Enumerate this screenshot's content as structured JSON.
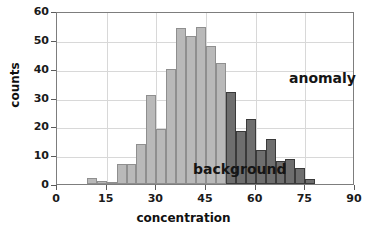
{
  "chart_data": {
    "type": "bar",
    "title": "",
    "subtitle": "",
    "xlabel": "concentration",
    "ylabel": "counts",
    "xlim": [
      0,
      90
    ],
    "ylim": [
      0,
      60
    ],
    "xticks": [
      0,
      15,
      30,
      45,
      60,
      75,
      90
    ],
    "yticks": [
      0,
      10,
      20,
      30,
      40,
      50,
      60
    ],
    "grid": true,
    "legend_position": "in-plot-annotations",
    "bin_width": 3,
    "annotations": [
      {
        "text": "anomaly",
        "x": 63,
        "y": 44
      },
      {
        "text": "background",
        "x": 35,
        "y": 12
      }
    ],
    "series": [
      {
        "name": "background",
        "color": "#b9b9b9",
        "edge_color": "#8f8f8f",
        "bins": [
          {
            "x0": 9,
            "x1": 12,
            "value": 2.0
          },
          {
            "x0": 12,
            "x1": 15,
            "value": 1.0
          },
          {
            "x0": 15,
            "x1": 18,
            "value": 0.3
          },
          {
            "x0": 18,
            "x1": 21,
            "value": 7.0
          },
          {
            "x0": 21,
            "x1": 24,
            "value": 7.0
          },
          {
            "x0": 24,
            "x1": 27,
            "value": 14.0
          },
          {
            "x0": 27,
            "x1": 30,
            "value": 31.0
          },
          {
            "x0": 30,
            "x1": 33,
            "value": 19.0
          },
          {
            "x0": 33,
            "x1": 36,
            "value": 40.0
          },
          {
            "x0": 36,
            "x1": 39,
            "value": 54.0
          },
          {
            "x0": 39,
            "x1": 42,
            "value": 51.5
          },
          {
            "x0": 42,
            "x1": 45,
            "value": 54.5
          },
          {
            "x0": 45,
            "x1": 48,
            "value": 48.0
          },
          {
            "x0": 48,
            "x1": 51,
            "value": 42.0
          },
          {
            "x0": 51,
            "x1": 54,
            "value": 31.0
          },
          {
            "x0": 54,
            "x1": 57,
            "value": 18.5
          },
          {
            "x0": 57,
            "x1": 60,
            "value": 11.5
          },
          {
            "x0": 60,
            "x1": 63,
            "value": 3.5
          },
          {
            "x0": 63,
            "x1": 66,
            "value": 3.5
          },
          {
            "x0": 66,
            "x1": 69,
            "value": 3.0
          },
          {
            "x0": 69,
            "x1": 72,
            "value": 3.0
          },
          {
            "x0": 72,
            "x1": 75,
            "value": 1.0
          }
        ]
      },
      {
        "name": "anomaly",
        "color": "#6e6e6e",
        "edge_color": "#3a3a3a",
        "bins": [
          {
            "x0": 51,
            "x1": 54,
            "value": 31.8
          },
          {
            "x0": 54,
            "x1": 57,
            "value": 18.5
          },
          {
            "x0": 57,
            "x1": 60,
            "value": 22.5
          },
          {
            "x0": 60,
            "x1": 63,
            "value": 11.8
          },
          {
            "x0": 63,
            "x1": 66,
            "value": 15.7
          },
          {
            "x0": 66,
            "x1": 69,
            "value": 8.0
          },
          {
            "x0": 69,
            "x1": 72,
            "value": 8.7
          },
          {
            "x0": 72,
            "x1": 75,
            "value": 5.7
          },
          {
            "x0": 75,
            "x1": 78,
            "value": 1.6
          }
        ]
      }
    ]
  },
  "axis": {
    "y_tick_labels": [
      "60",
      "50",
      "40",
      "30",
      "20",
      "10",
      "0"
    ],
    "x_tick_labels": [
      "0",
      "15",
      "30",
      "45",
      "60",
      "75",
      "90"
    ],
    "x_title": "concentration",
    "y_title": "counts"
  },
  "labels": {
    "anomaly": "anomaly",
    "background": "background"
  }
}
